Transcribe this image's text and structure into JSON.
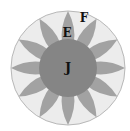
{
  "diagram": {
    "outer_circle": {
      "cx": 68,
      "cy": 68,
      "r": 57,
      "fill": "#ececec",
      "stroke": "#b8b8b8"
    },
    "inner_circle": {
      "cx": 68,
      "cy": 68,
      "r": 29,
      "fill": "#858585"
    },
    "petals": {
      "count": 12,
      "fill": "#a2a2a2",
      "tip_radius": 57,
      "base_radius": 26,
      "half_width_deg": 13
    },
    "labels": {
      "inner": "J",
      "petal": "E",
      "outer": "F"
    },
    "colors": {
      "background": "#ffffff",
      "outer_region": "#ececec",
      "petal": "#a2a2a2",
      "inner_region": "#858585",
      "text": "#111111"
    }
  }
}
